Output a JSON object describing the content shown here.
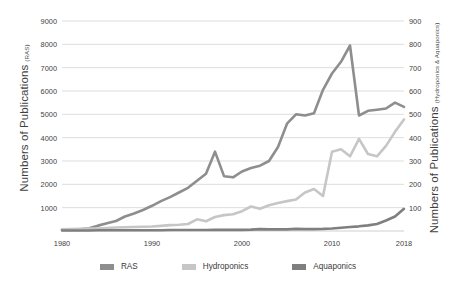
{
  "chart_data": {
    "type": "line",
    "title": "",
    "xlabel": "",
    "grid": true,
    "legend_position": "bottom",
    "x": [
      1980,
      1981,
      1982,
      1983,
      1984,
      1985,
      1986,
      1987,
      1988,
      1989,
      1990,
      1991,
      1992,
      1993,
      1994,
      1995,
      1996,
      1997,
      1998,
      1999,
      2000,
      2001,
      2002,
      2003,
      2004,
      2005,
      2006,
      2007,
      2008,
      2009,
      2010,
      2011,
      2012,
      2013,
      2014,
      2015,
      2016,
      2017,
      2018
    ],
    "xticks": [
      1980,
      1990,
      2000,
      2010,
      2018
    ],
    "xlim": [
      1980,
      2018
    ],
    "left_axis": {
      "label_main": "Numbers of Publications",
      "label_sub": "(RAS)",
      "ticks": [
        1000,
        2000,
        3000,
        4000,
        5000,
        6000,
        7000,
        8000,
        9000
      ],
      "ylim": [
        0,
        9000
      ]
    },
    "right_axis": {
      "label_main": "Numbers of Publications",
      "label_sub": "(Hydroponics & Aquaponics)",
      "ticks": [
        100,
        200,
        300,
        400,
        500,
        600,
        700,
        800,
        900
      ],
      "ylim": [
        0,
        900
      ]
    },
    "series": [
      {
        "name": "RAS",
        "axis": "left",
        "color": "#8e8e8e",
        "values": [
          60,
          65,
          70,
          120,
          230,
          330,
          430,
          620,
          750,
          900,
          1080,
          1280,
          1450,
          1650,
          1850,
          2150,
          2450,
          3400,
          2350,
          2300,
          2550,
          2700,
          2800,
          3000,
          3600,
          4600,
          5000,
          4950,
          5050,
          6050,
          6750,
          7250,
          7950,
          4950,
          5150,
          5200,
          5250,
          5500,
          5320
        ]
      },
      {
        "name": "Hydroponics",
        "axis": "right",
        "color": "#c6c6c6",
        "values": [
          7,
          8,
          9,
          10,
          11,
          13,
          15,
          16,
          17,
          18,
          19,
          22,
          25,
          27,
          30,
          50,
          42,
          60,
          68,
          72,
          85,
          105,
          95,
          110,
          120,
          128,
          135,
          165,
          180,
          150,
          340,
          350,
          320,
          395,
          330,
          320,
          365,
          425,
          478
        ]
      },
      {
        "name": "Aquaponics",
        "axis": "right",
        "color": "#7f7f7f",
        "values": [
          2,
          2,
          2,
          2,
          3,
          3,
          3,
          3,
          3,
          3,
          3,
          3,
          4,
          4,
          4,
          4,
          4,
          5,
          5,
          5,
          5,
          6,
          8,
          7,
          7,
          7,
          9,
          8,
          8,
          9,
          11,
          14,
          17,
          20,
          24,
          30,
          45,
          62,
          95
        ]
      }
    ]
  },
  "legend": {
    "items": [
      {
        "label": "RAS",
        "color": "#8e8e8e"
      },
      {
        "label": "Hydroponics",
        "color": "#c6c6c6"
      },
      {
        "label": "Aquaponics",
        "color": "#7f7f7f"
      }
    ]
  },
  "caption": {
    "text": ""
  },
  "colors": {
    "gridline": "#d9d9d9",
    "baseline": "#c9c9c9",
    "text": "#3f3f3f",
    "background": "#ffffff"
  }
}
